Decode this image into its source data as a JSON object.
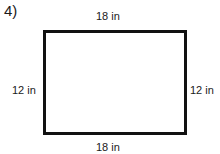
{
  "problem": {
    "number": "4)"
  },
  "rectangle": {
    "top_label": "18 in",
    "bottom_label": "18 in",
    "left_label": "12 in",
    "right_label": "12 in",
    "stroke_color": "#111111"
  }
}
